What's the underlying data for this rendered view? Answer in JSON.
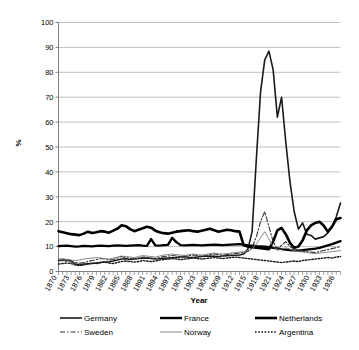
{
  "chart_data": {
    "type": "line",
    "title": "",
    "xlabel": "Year",
    "ylabel": "%",
    "ylim": [
      0,
      100
    ],
    "ytick_step": 10,
    "yticks": [
      0,
      10,
      20,
      30,
      40,
      50,
      60,
      70,
      80,
      90,
      100
    ],
    "grid": "horizontal",
    "legend_position": "bottom",
    "legend_columns": 3,
    "xlim": [
      1870,
      1937
    ],
    "xtick_labels": [
      "1870",
      "1873",
      "1876",
      "1879",
      "1882",
      "1885",
      "1888",
      "1891",
      "1894",
      "1897",
      "1900",
      "1903",
      "1906",
      "1909",
      "1912",
      "1915",
      "1918",
      "1921",
      "1924",
      "1927",
      "1930",
      "1933",
      "1936"
    ],
    "x": [
      1870,
      1871,
      1872,
      1873,
      1874,
      1875,
      1876,
      1877,
      1878,
      1879,
      1880,
      1881,
      1882,
      1883,
      1884,
      1885,
      1886,
      1887,
      1888,
      1889,
      1890,
      1891,
      1892,
      1893,
      1894,
      1895,
      1896,
      1897,
      1898,
      1899,
      1900,
      1901,
      1902,
      1903,
      1904,
      1905,
      1906,
      1907,
      1908,
      1909,
      1910,
      1911,
      1912,
      1913,
      1914,
      1915,
      1916,
      1917,
      1918,
      1919,
      1920,
      1921,
      1922,
      1923,
      1924,
      1925,
      1926,
      1927,
      1928,
      1929,
      1930,
      1931,
      1932,
      1933,
      1934,
      1935,
      1936,
      1937
    ],
    "series": [
      {
        "name": "Germany",
        "style": "solid-medium",
        "color": "#1a1a1a",
        "width": 1.6,
        "dash": "",
        "values": [
          4.5,
          4.6,
          4.7,
          4.3,
          3.0,
          2.8,
          3.0,
          3.1,
          3.2,
          3.4,
          3.6,
          3.8,
          3.9,
          4.2,
          4.6,
          5.0,
          5.1,
          4.8,
          5.0,
          5.2,
          5.3,
          5.4,
          5.2,
          5.0,
          5.1,
          5.3,
          5.4,
          5.5,
          5.6,
          5.8,
          5.9,
          5.7,
          5.6,
          5.8,
          6.0,
          6.1,
          6.2,
          6.1,
          6.0,
          6.2,
          6.3,
          6.4,
          6.5,
          6.6,
          7.0,
          9.0,
          16.0,
          45.0,
          72.0,
          85.0,
          88.5,
          81.0,
          62.0,
          70.0,
          52.0,
          36.0,
          24.0,
          17.0,
          19.5,
          15.0,
          14.5,
          13.0,
          13.5,
          14.0,
          15.5,
          18.0,
          22.0,
          27.5
        ]
      },
      {
        "name": "France",
        "style": "solid-thick",
        "color": "#000000",
        "width": 2.4,
        "dash": "",
        "values": [
          10.2,
          10.3,
          10.4,
          10.2,
          10.0,
          10.1,
          10.3,
          10.2,
          10.1,
          10.3,
          10.4,
          10.3,
          10.2,
          10.4,
          10.5,
          10.4,
          10.3,
          10.4,
          10.5,
          10.6,
          10.4,
          10.3,
          13.0,
          10.5,
          10.4,
          10.6,
          10.7,
          13.5,
          11.8,
          10.6,
          10.5,
          10.6,
          10.7,
          10.6,
          10.5,
          10.6,
          10.7,
          10.8,
          10.7,
          10.6,
          10.7,
          10.8,
          10.9,
          11.0,
          10.8,
          10.5,
          10.4,
          10.2,
          10.1,
          10.0,
          9.8,
          9.5,
          9.3,
          9.0,
          8.8,
          8.6,
          8.5,
          8.4,
          8.6,
          8.8,
          9.0,
          9.2,
          9.5,
          10.0,
          10.5,
          11.0,
          11.6,
          12.2
        ]
      },
      {
        "name": "Netherlands",
        "style": "solid-heavy",
        "color": "#000000",
        "width": 2.6,
        "dash": "",
        "values": [
          16.2,
          15.8,
          15.4,
          15.0,
          14.8,
          14.6,
          15.2,
          16.0,
          15.5,
          15.8,
          16.2,
          16.0,
          15.6,
          16.4,
          17.2,
          18.6,
          18.2,
          17.0,
          16.2,
          16.8,
          17.4,
          18.0,
          17.6,
          16.4,
          15.8,
          15.4,
          15.2,
          15.6,
          16.0,
          16.2,
          16.4,
          16.6,
          16.2,
          16.0,
          16.4,
          16.8,
          17.2,
          16.6,
          16.0,
          16.4,
          16.8,
          16.6,
          16.2,
          16.0,
          10.5,
          10.0,
          9.8,
          9.6,
          9.4,
          9.2,
          9.0,
          12.0,
          16.5,
          17.5,
          15.0,
          11.5,
          9.5,
          10.0,
          12.5,
          16.5,
          18.5,
          19.5,
          20.0,
          18.5,
          16.0,
          18.0,
          21.0,
          21.5
        ]
      },
      {
        "name": "Sweden",
        "style": "dash-dot",
        "color": "#333333",
        "width": 1.1,
        "dash": "5,2,1.5,2",
        "values": [
          4.2,
          4.4,
          4.0,
          3.8,
          3.6,
          3.4,
          3.6,
          4.0,
          4.4,
          4.8,
          5.2,
          5.0,
          4.6,
          4.8,
          5.4,
          6.0,
          5.6,
          5.2,
          5.0,
          5.4,
          5.8,
          5.6,
          5.4,
          5.2,
          5.6,
          6.0,
          6.2,
          6.4,
          6.2,
          6.0,
          6.2,
          6.4,
          6.6,
          6.4,
          6.2,
          6.4,
          6.8,
          7.0,
          6.8,
          6.6,
          6.8,
          7.0,
          7.2,
          7.4,
          7.6,
          8.0,
          9.5,
          14.0,
          20.0,
          24.0,
          18.0,
          12.0,
          9.0,
          10.5,
          12.0,
          10.0,
          9.0,
          8.5,
          8.2,
          8.0,
          7.8,
          7.6,
          8.0,
          8.4,
          8.8,
          9.2,
          9.6,
          10.0
        ]
      },
      {
        "name": "Norway",
        "style": "solid-thin",
        "color": "#7a7a7a",
        "width": 0.9,
        "dash": "",
        "values": [
          5.0,
          5.2,
          4.8,
          4.6,
          4.4,
          4.6,
          5.0,
          5.2,
          5.4,
          5.6,
          5.4,
          5.2,
          5.0,
          5.4,
          5.8,
          6.2,
          6.0,
          5.8,
          5.6,
          6.0,
          6.4,
          6.2,
          6.0,
          5.8,
          6.2,
          6.6,
          6.8,
          7.0,
          6.8,
          6.6,
          6.4,
          6.8,
          7.0,
          6.8,
          6.6,
          6.8,
          7.2,
          7.4,
          7.2,
          7.0,
          7.2,
          7.4,
          7.6,
          7.8,
          8.0,
          8.4,
          9.0,
          11.0,
          13.5,
          16.0,
          13.0,
          10.0,
          8.5,
          9.0,
          9.5,
          9.0,
          8.5,
          8.0,
          7.8,
          7.6,
          7.4,
          7.2,
          7.4,
          7.6,
          7.8,
          8.0,
          8.2,
          8.4
        ]
      },
      {
        "name": "Argentina",
        "style": "dotted",
        "color": "#1a1a1a",
        "width": 1.4,
        "dash": "1.6,1.6",
        "values": [
          3.0,
          3.2,
          3.4,
          3.2,
          2.6,
          2.4,
          2.6,
          3.0,
          3.4,
          3.2,
          3.6,
          3.8,
          3.4,
          3.2,
          3.6,
          4.0,
          4.2,
          4.0,
          3.8,
          4.0,
          4.4,
          4.2,
          4.0,
          4.2,
          4.6,
          4.8,
          5.0,
          5.2,
          5.0,
          4.8,
          5.0,
          5.2,
          5.4,
          5.2,
          5.0,
          5.2,
          5.4,
          5.6,
          5.4,
          5.2,
          5.4,
          5.6,
          5.8,
          5.6,
          5.4,
          5.2,
          5.0,
          4.8,
          4.6,
          4.4,
          4.2,
          4.0,
          3.8,
          3.6,
          3.8,
          4.0,
          4.2,
          4.0,
          4.4,
          4.6,
          4.8,
          5.0,
          5.2,
          5.4,
          5.6,
          5.4,
          5.8,
          6.0
        ]
      }
    ],
    "legend": [
      {
        "label": "Germany",
        "style": "solid-medium"
      },
      {
        "label": "France",
        "style": "solid-thick"
      },
      {
        "label": "Netherlands",
        "style": "solid-heavy"
      },
      {
        "label": "Sweden",
        "style": "dash-dot"
      },
      {
        "label": "Norway",
        "style": "solid-thin"
      },
      {
        "label": "Argentina",
        "style": "dotted"
      }
    ],
    "colors": {
      "grid": "#b0b0b0",
      "axis": "#808080",
      "background": "#ffffff",
      "text": "#000000"
    }
  }
}
